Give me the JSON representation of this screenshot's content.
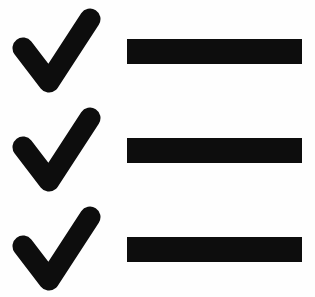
{
  "image": {
    "title": "Checklist icon",
    "background_color": "#fefefe",
    "foreground_color": "#0d0d0d",
    "width": 315,
    "height": 297
  },
  "checklist": {
    "rows": [
      {
        "index": 1,
        "check_icon": "check-mark-icon",
        "bar_label": "",
        "checked": "true"
      },
      {
        "index": 2,
        "check_icon": "check-mark-icon",
        "bar_label": "",
        "checked": "true"
      },
      {
        "index": 3,
        "check_icon": "check-mark-icon",
        "bar_label": "",
        "checked": "true"
      }
    ]
  }
}
